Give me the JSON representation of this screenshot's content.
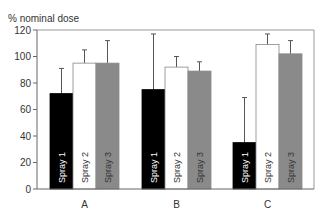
{
  "chart_data": {
    "type": "bar",
    "title": "",
    "xlabel": "",
    "ylabel": "% nominal dose",
    "ylim": [
      0,
      120
    ],
    "yticks": [
      0,
      20,
      40,
      60,
      80,
      100,
      120
    ],
    "grid": false,
    "legend": "none (series names printed inside bars)",
    "categories": [
      "A",
      "B",
      "C"
    ],
    "series": [
      {
        "name": "Spray 1",
        "color": "#000000",
        "label_color": "#ffffff",
        "values": [
          72,
          75,
          35
        ],
        "error_upper": [
          91,
          117,
          69
        ]
      },
      {
        "name": "Spray 2",
        "color": "#ffffff",
        "label_color": "#333333",
        "values": [
          95,
          92,
          109
        ],
        "error_upper": [
          105,
          100,
          117
        ]
      },
      {
        "name": "Spray 3",
        "color": "#8a8a8a",
        "label_color": "#333333",
        "values": [
          95,
          89,
          102
        ],
        "error_upper": [
          112,
          96,
          112
        ]
      }
    ]
  }
}
